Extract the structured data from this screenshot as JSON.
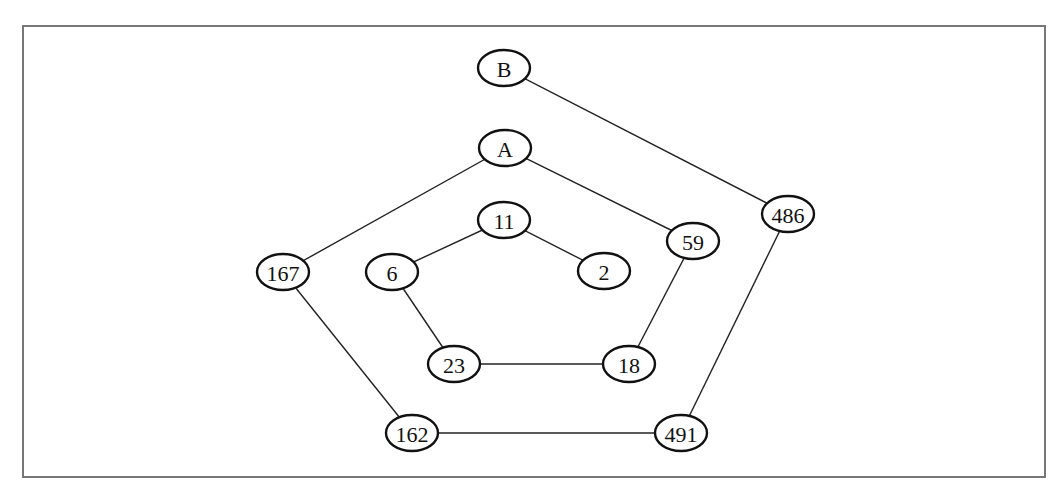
{
  "header_fragment": "",
  "graph": {
    "nodes": [
      {
        "id": "B",
        "label": "B",
        "x": 504,
        "y": 68
      },
      {
        "id": "A",
        "label": "A",
        "x": 505,
        "y": 148
      },
      {
        "id": "11",
        "label": "11",
        "x": 504,
        "y": 220
      },
      {
        "id": "167",
        "label": "167",
        "x": 283,
        "y": 272
      },
      {
        "id": "6",
        "label": "6",
        "x": 392,
        "y": 272
      },
      {
        "id": "2",
        "label": "2",
        "x": 604,
        "y": 271
      },
      {
        "id": "59",
        "label": "59",
        "x": 693,
        "y": 241
      },
      {
        "id": "486",
        "label": "486",
        "x": 788,
        "y": 214
      },
      {
        "id": "23",
        "label": "23",
        "x": 454,
        "y": 364
      },
      {
        "id": "18",
        "label": "18",
        "x": 629,
        "y": 364
      },
      {
        "id": "162",
        "label": "162",
        "x": 412,
        "y": 433
      },
      {
        "id": "491",
        "label": "491",
        "x": 681,
        "y": 433
      }
    ],
    "edges": [
      [
        "B",
        "486"
      ],
      [
        "486",
        "491"
      ],
      [
        "491",
        "162"
      ],
      [
        "162",
        "167"
      ],
      [
        "167",
        "A"
      ],
      [
        "A",
        "59"
      ],
      [
        "59",
        "18"
      ],
      [
        "18",
        "23"
      ],
      [
        "23",
        "6"
      ],
      [
        "6",
        "11"
      ],
      [
        "11",
        "2"
      ]
    ]
  }
}
